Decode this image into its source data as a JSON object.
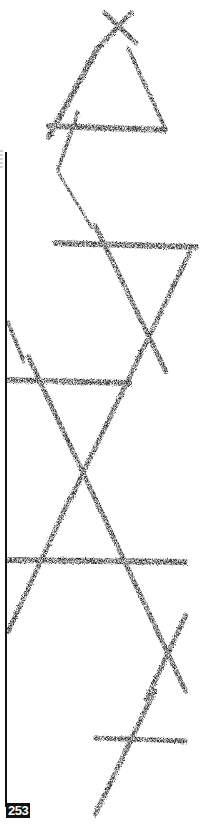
{
  "page": {
    "page_number": "253",
    "background_color": "#ffffff",
    "ink_color": "#1a1a1a"
  },
  "artwork": {
    "description": "Hand-drawn charcoal strokes forming a chain of triangles and crossing X marks",
    "strokes": [
      {
        "id": "top-x-a",
        "from": [
          104,
          12
        ],
        "to": [
          137,
          44
        ],
        "width": 5
      },
      {
        "id": "top-x-b",
        "from": [
          132,
          12
        ],
        "to": [
          98,
          48
        ],
        "width": 5
      },
      {
        "id": "top-left-leg",
        "from": [
          98,
          48
        ],
        "to": [
          48,
          138
        ],
        "width": 6
      },
      {
        "id": "top-right-leg",
        "from": [
          128,
          48
        ],
        "to": [
          165,
          128
        ],
        "width": 4
      },
      {
        "id": "top-base",
        "from": [
          48,
          126
        ],
        "to": [
          166,
          130
        ],
        "width": 6
      },
      {
        "id": "mid-left-upper",
        "from": [
          78,
          112
        ],
        "to": [
          58,
          170
        ],
        "width": 4
      },
      {
        "id": "mid-left-lower",
        "from": [
          58,
          172
        ],
        "to": [
          92,
          228
        ],
        "width": 3
      },
      {
        "id": "upper-horizontal",
        "from": [
          55,
          243
        ],
        "to": [
          197,
          247
        ],
        "width": 6
      },
      {
        "id": "down-right-diagonal",
        "from": [
          95,
          225
        ],
        "to": [
          166,
          372
        ],
        "width": 5
      },
      {
        "id": "down-left-diagonal",
        "from": [
          190,
          252
        ],
        "to": [
          70,
          500
        ],
        "width": 5
      },
      {
        "id": "middle-horizontal",
        "from": [
          8,
          380
        ],
        "to": [
          130,
          383
        ],
        "width": 6
      },
      {
        "id": "left-upper-diagonal",
        "from": [
          8,
          322
        ],
        "to": [
          24,
          362
        ],
        "width": 4
      },
      {
        "id": "left-long-diagonal",
        "from": [
          28,
          356
        ],
        "to": [
          186,
          692
        ],
        "width": 5
      },
      {
        "id": "lower-horizontal",
        "from": [
          8,
          560
        ],
        "to": [
          186,
          562
        ],
        "width": 6
      },
      {
        "id": "lower-left-diagonal",
        "from": [
          70,
          498
        ],
        "to": [
          8,
          632
        ],
        "width": 5
      },
      {
        "id": "lower-right-x",
        "from": [
          186,
          615
        ],
        "to": [
          146,
          700
        ],
        "width": 5
      },
      {
        "id": "bottom-diagonal",
        "from": [
          155,
          690
        ],
        "to": [
          95,
          815
        ],
        "width": 5
      },
      {
        "id": "bottom-horizontal",
        "from": [
          95,
          738
        ],
        "to": [
          186,
          741
        ],
        "width": 5
      }
    ]
  }
}
